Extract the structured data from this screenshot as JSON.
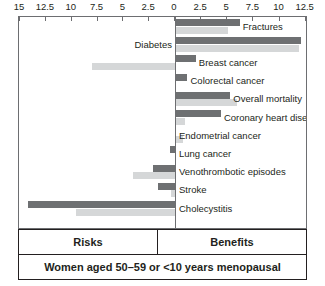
{
  "chart_data": {
    "type": "bar",
    "title": "",
    "subtitle": "",
    "orientation": "horizontal-diverging",
    "xlabel": "",
    "ylabel": "",
    "grid": false,
    "legend_position": "none",
    "axis": {
      "left_label": "Risks",
      "right_label": "Benefits",
      "left_max": 15,
      "right_max": 12.5,
      "tick_labels_left": [
        "15",
        "12.5",
        "10",
        "7.5",
        "5",
        "2.5"
      ],
      "tick_labels_right": [
        "0",
        "2.5",
        "5",
        "7.5",
        "10",
        "12.5"
      ],
      "tick_values_left": [
        15,
        12.5,
        10,
        7.5,
        5,
        2.5
      ],
      "tick_values_right": [
        0,
        2.5,
        5,
        7.5,
        10,
        12.5
      ],
      "center_value": 0
    },
    "series": [
      {
        "name": "upper-bar",
        "color": "#6e7072"
      },
      {
        "name": "lower-bar",
        "color": "#d5d7d8"
      }
    ],
    "categories": [
      "Fractures",
      "Diabetes",
      "Breast cancer",
      "Colorectal cancer",
      "Overall mortality",
      "Coronary heart disease",
      "Endometrial cancer",
      "Lung cancer",
      "Venothrombotic episodes",
      "Stroke",
      "Cholecystitis"
    ],
    "rows": [
      {
        "label": "Fractures",
        "label_side": "right",
        "upper_side": "benefits",
        "upper": 6.1,
        "lower_side": "benefits",
        "lower": 5.0
      },
      {
        "label": "Diabetes",
        "label_side": "left",
        "upper_side": "benefits",
        "upper": 12.0,
        "lower_side": "benefits",
        "lower": 11.8
      },
      {
        "label": "Breast cancer",
        "label_side": "right",
        "upper_side": "benefits",
        "upper": 1.9,
        "lower_side": "risks",
        "lower": 8.0
      },
      {
        "label": "Colorectal cancer",
        "label_side": "right",
        "upper_side": "benefits",
        "upper": 1.1,
        "lower_side": "benefits",
        "lower": 0.0
      },
      {
        "label": "Overall mortality",
        "label_side": "right",
        "upper_side": "benefits",
        "upper": 5.2,
        "lower_side": "benefits",
        "lower": 5.8
      },
      {
        "label": "Coronary heart disease",
        "label_side": "right",
        "upper_side": "benefits",
        "upper": 4.3,
        "lower_side": "benefits",
        "lower": 0.9
      },
      {
        "label": "Endometrial cancer",
        "label_side": "right",
        "upper_side": "benefits",
        "upper": 0.0,
        "lower_side": "benefits",
        "lower": 0.7
      },
      {
        "label": "Lung cancer",
        "label_side": "right",
        "upper_side": "risks",
        "upper": 0.5,
        "lower_side": "benefits",
        "lower": 0.0
      },
      {
        "label": "Venothrombotic episodes",
        "label_side": "right",
        "upper_side": "risks",
        "upper": 2.1,
        "lower_side": "risks",
        "lower": 4.1
      },
      {
        "label": "Stroke",
        "label_side": "right",
        "upper_side": "risks",
        "upper": 1.6,
        "lower_side": "risks",
        "lower": 0.4
      },
      {
        "label": "Cholecystitis",
        "label_side": "right",
        "upper_side": "risks",
        "upper": 14.2,
        "lower_side": "risks",
        "lower": 9.6
      }
    ],
    "colors": {
      "upper_bar": "#6e7072",
      "lower_bar": "#d5d7d8",
      "axis": "#6d6e71",
      "frame": "#231f20",
      "text": "#231f20",
      "background": "#ffffff"
    }
  },
  "footer": {
    "risks_label": "Risks",
    "benefits_label": "Benefits"
  },
  "caption": {
    "text": "Women aged 50–59 or <10 years menopausal"
  }
}
